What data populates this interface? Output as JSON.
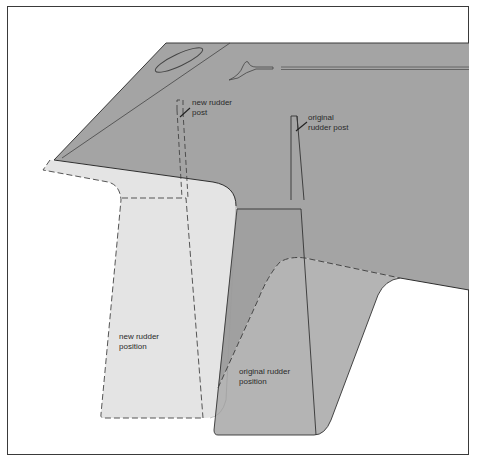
{
  "diagram": {
    "type": "technical-illustration",
    "colors": {
      "background": "#ffffff",
      "frame": "#3a3a3a",
      "hull": "#a4a4a4",
      "original_rudder": "#b3b3b3",
      "new_rudder": "#e4e4e4",
      "outline": "#333333",
      "text": "#2a2a2a"
    },
    "labels": {
      "new_rudder_post": "new rudder\npost",
      "original_rudder_post": "original\nrudder post",
      "new_rudder_position": "new rudder\nposition",
      "original_rudder_position": "original rudder\nposition"
    },
    "elements": [
      {
        "name": "hull",
        "style": "solid fill, dark grey"
      },
      {
        "name": "original-rudder",
        "style": "solid outline, medium grey"
      },
      {
        "name": "new-rudder",
        "style": "dashed outline, light grey"
      },
      {
        "name": "original-rudder-post",
        "style": "solid narrow shaft"
      },
      {
        "name": "new-rudder-post",
        "style": "dashed narrow shaft"
      },
      {
        "name": "original-skeg",
        "style": "dashed top edge, light grey fill"
      }
    ]
  }
}
